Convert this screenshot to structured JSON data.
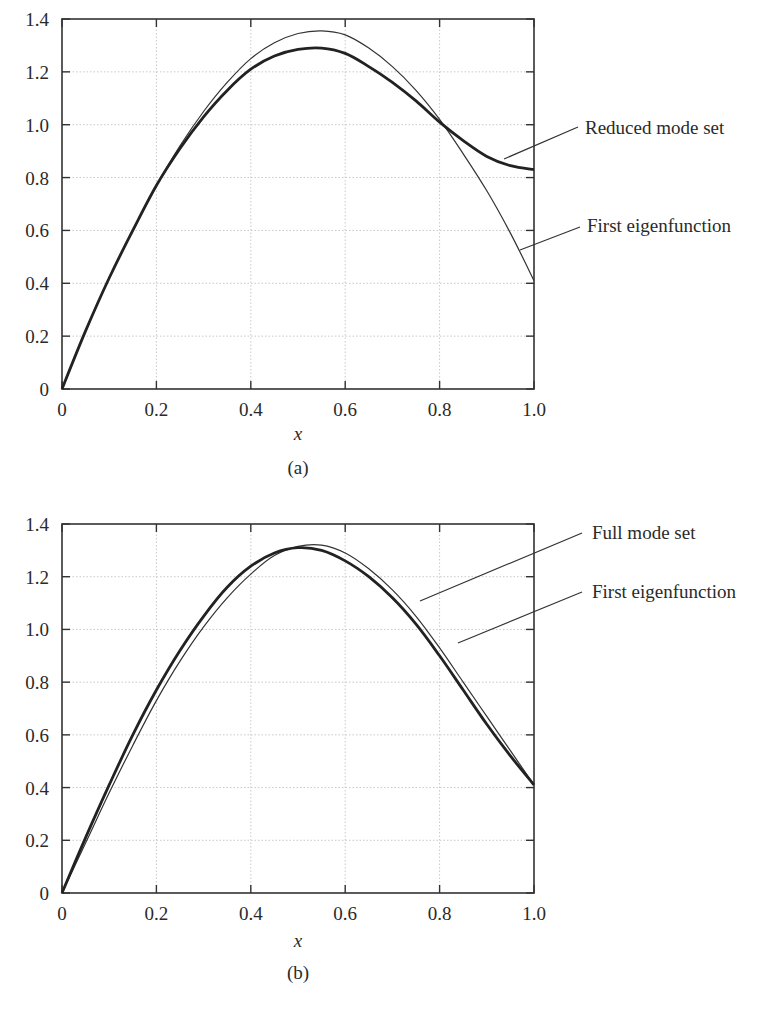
{
  "chart_data": [
    {
      "id": "a",
      "type": "line",
      "caption": "(a)",
      "xlabel": "x",
      "ylabel": "",
      "xlim": [
        0,
        1.0
      ],
      "ylim": [
        0,
        1.4
      ],
      "xticks": [
        "0",
        "0.2",
        "0.4",
        "0.6",
        "0.8",
        "1.0"
      ],
      "yticks": [
        "0",
        "0.2",
        "0.4",
        "0.6",
        "0.8",
        "1.0",
        "1.2",
        "1.4"
      ],
      "grid": true,
      "x": [
        0,
        0.05,
        0.1,
        0.15,
        0.2,
        0.25,
        0.3,
        0.35,
        0.4,
        0.45,
        0.5,
        0.55,
        0.6,
        0.65,
        0.7,
        0.75,
        0.8,
        0.85,
        0.9,
        0.95,
        1.0
      ],
      "series": [
        {
          "name": "Reduced mode set",
          "style": "thick",
          "values": [
            0,
            0.22,
            0.42,
            0.6,
            0.77,
            0.91,
            1.03,
            1.13,
            1.21,
            1.26,
            1.285,
            1.29,
            1.27,
            1.22,
            1.16,
            1.09,
            1.01,
            0.94,
            0.88,
            0.845,
            0.83
          ]
        },
        {
          "name": "First eigenfunction",
          "style": "thin",
          "values": [
            0,
            0.22,
            0.42,
            0.6,
            0.77,
            0.92,
            1.05,
            1.16,
            1.25,
            1.31,
            1.345,
            1.355,
            1.34,
            1.29,
            1.22,
            1.13,
            1.02,
            0.89,
            0.75,
            0.59,
            0.41
          ]
        }
      ],
      "annotations": [
        {
          "text": "Reduced mode set",
          "target_series": "Reduced mode set",
          "point": [
            0.93,
            0.87
          ]
        },
        {
          "text": "First eigenfunction",
          "target_series": "First eigenfunction",
          "point": [
            0.93,
            0.56
          ]
        }
      ]
    },
    {
      "id": "b",
      "type": "line",
      "caption": "(b)",
      "xlabel": "x",
      "ylabel": "",
      "xlim": [
        0,
        1.0
      ],
      "ylim": [
        0,
        1.4
      ],
      "xticks": [
        "0",
        "0.2",
        "0.4",
        "0.6",
        "0.8",
        "1.0"
      ],
      "yticks": [
        "0",
        "0.2",
        "0.4",
        "0.6",
        "0.8",
        "1.0",
        "1.2",
        "1.4"
      ],
      "grid": true,
      "x": [
        0,
        0.05,
        0.1,
        0.15,
        0.2,
        0.25,
        0.3,
        0.35,
        0.4,
        0.45,
        0.5,
        0.55,
        0.6,
        0.65,
        0.7,
        0.75,
        0.8,
        0.85,
        0.9,
        0.95,
        1.0
      ],
      "series": [
        {
          "name": "Full mode set",
          "style": "thick",
          "values": [
            0,
            0.21,
            0.41,
            0.6,
            0.77,
            0.92,
            1.05,
            1.16,
            1.24,
            1.29,
            1.31,
            1.3,
            1.26,
            1.2,
            1.12,
            1.02,
            0.9,
            0.77,
            0.64,
            0.52,
            0.41
          ]
        },
        {
          "name": "First eigenfunction",
          "style": "thin",
          "values": [
            0,
            0.19,
            0.38,
            0.56,
            0.73,
            0.88,
            1.01,
            1.12,
            1.21,
            1.28,
            1.315,
            1.32,
            1.29,
            1.23,
            1.15,
            1.05,
            0.93,
            0.8,
            0.67,
            0.54,
            0.41
          ]
        }
      ],
      "annotations": [
        {
          "text": "Full mode set",
          "target_series": "Full mode set",
          "point": [
            0.75,
            1.08
          ]
        },
        {
          "text": "First eigenfunction",
          "target_series": "First eigenfunction",
          "point": [
            0.79,
            1.02
          ]
        }
      ]
    }
  ],
  "panels": {
    "a": {
      "caption": "(a)",
      "xlabel": "x",
      "label_reduced": "Reduced mode set",
      "label_first": "First eigenfunction"
    },
    "b": {
      "caption": "(b)",
      "xlabel": "x",
      "label_full": "Full mode set",
      "label_first": "First eigenfunction"
    }
  }
}
